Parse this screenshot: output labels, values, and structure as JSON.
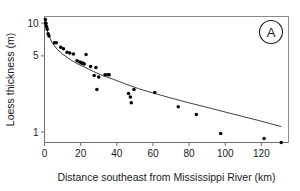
{
  "chart_data": {
    "type": "scatter",
    "title": "",
    "panel_label": "A",
    "xlabel": "Distance southeast from Mississippi River (km)",
    "ylabel": "Loess thickness (m)",
    "yscale": "log",
    "xscale": "linear",
    "xlim": [
      0,
      135
    ],
    "ylim": [
      0.8,
      11.5
    ],
    "xticks": [
      0,
      20,
      40,
      60,
      80,
      100,
      120
    ],
    "xtick_labels": [
      "0",
      "20",
      "40",
      "60",
      "80",
      "100",
      "120"
    ],
    "yticks": [
      1,
      5,
      10
    ],
    "ytick_labels": [
      "1",
      "5",
      "10"
    ],
    "grid": false,
    "legend": "none",
    "marker": "filled-circle",
    "series": [
      {
        "name": "Loess thickness observations",
        "x": [
          0.5,
          0.6,
          0.8,
          1.0,
          1.2,
          1.5,
          2.0,
          2.5,
          5.5,
          6.5,
          9.0,
          10.5,
          12.5,
          14.0,
          16.0,
          18.0,
          19.5,
          20.5,
          21.0,
          21.5,
          22.0,
          23.0,
          25.5,
          27.5,
          28.5,
          29.0,
          30.0,
          33.5,
          35.0,
          35.8,
          46.5,
          47.5,
          48.0,
          49.5,
          61.0,
          74.0,
          84.0,
          97.5,
          121.5,
          131.0
        ],
        "y": [
          10.8,
          10.0,
          9.9,
          9.4,
          9.2,
          8.8,
          8.0,
          7.6,
          6.6,
          6.6,
          6.0,
          5.8,
          5.4,
          5.3,
          5.2,
          4.5,
          4.4,
          4.3,
          4.3,
          4.25,
          4.2,
          5.15,
          4.0,
          3.3,
          3.9,
          2.45,
          3.2,
          3.35,
          3.35,
          3.35,
          2.25,
          2.1,
          1.85,
          2.45,
          2.3,
          1.7,
          1.45,
          0.97,
          0.87,
          0.8
        ]
      }
    ],
    "fit_curve": {
      "name": "power-law fit",
      "x": [
        0.3,
        1,
        2,
        4,
        7,
        10,
        14,
        18,
        22,
        27,
        32,
        38,
        45,
        52,
        60,
        70,
        80,
        92,
        105,
        118,
        131
      ],
      "y": [
        10.9,
        9.3,
        8.0,
        6.7,
        5.75,
        5.2,
        4.65,
        4.25,
        3.95,
        3.6,
        3.3,
        3.05,
        2.75,
        2.5,
        2.28,
        2.05,
        1.85,
        1.65,
        1.45,
        1.28,
        1.12
      ]
    },
    "colors": {
      "marker": "#000000",
      "curve": "#2b2b2b",
      "axis": "#6e6e6e",
      "frame": "#8a8a8a",
      "text": "#1a1a1a",
      "background": "#ffffff"
    }
  }
}
